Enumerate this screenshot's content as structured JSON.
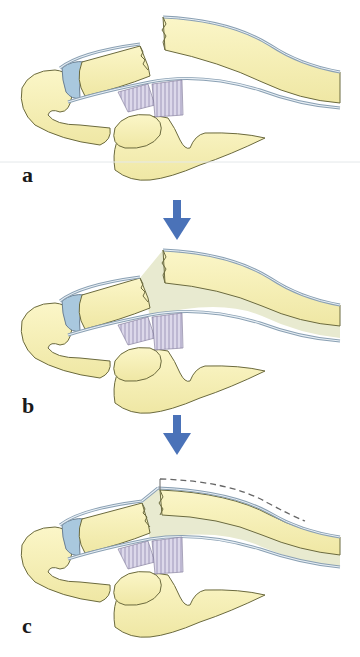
{
  "figure": {
    "panels": [
      {
        "id": "a",
        "label": "a",
        "state": "tendon-ruptured-separated"
      },
      {
        "id": "b",
        "label": "b",
        "state": "gap-bridged-by-scar"
      },
      {
        "id": "c",
        "label": "c",
        "state": "healed-with-elevation"
      }
    ],
    "arrows": [
      {
        "from": "a",
        "to": "b",
        "direction": "down"
      },
      {
        "from": "b",
        "to": "c",
        "direction": "down"
      }
    ],
    "colors": {
      "bone": "#f5efb4",
      "bone_outline": "#6b6a3e",
      "tendon_sheath": "#c9d7e4",
      "cartilage": "#a9c8de",
      "ligament": "#d8d4e8",
      "scar_tissue": "#e8ead0",
      "arrow": "#4a72b8",
      "label_text": "#1a1a1a"
    }
  }
}
